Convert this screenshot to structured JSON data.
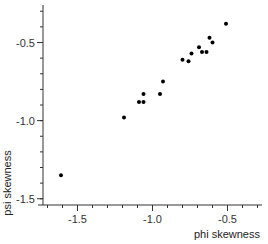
{
  "chart_data": {
    "type": "scatter",
    "title": "",
    "xlabel": "phi skewness",
    "ylabel": "psi skewness",
    "xlim": [
      -1.73,
      -0.27
    ],
    "ylim": [
      -1.54,
      -0.26
    ],
    "grid": false,
    "legend": null,
    "x_ticks": {
      "major": [
        -1.5,
        -1.0,
        -0.5
      ],
      "labels": [
        "-1.5",
        "-1.0",
        "-0.5"
      ],
      "minor_step": 0.1
    },
    "y_ticks": {
      "major": [
        -1.5,
        -1.0,
        -0.5
      ],
      "labels": [
        "-1.5",
        "-1.0",
        "-0.5"
      ],
      "minor_step": 0.1
    },
    "series": [
      {
        "name": "samples",
        "color": "#000000",
        "points": [
          {
            "x": -1.61,
            "y": -1.35
          },
          {
            "x": -1.19,
            "y": -0.98
          },
          {
            "x": -1.09,
            "y": -0.88
          },
          {
            "x": -1.06,
            "y": -0.88
          },
          {
            "x": -1.06,
            "y": -0.83
          },
          {
            "x": -0.95,
            "y": -0.83
          },
          {
            "x": -0.93,
            "y": -0.75
          },
          {
            "x": -0.8,
            "y": -0.61
          },
          {
            "x": -0.76,
            "y": -0.62
          },
          {
            "x": -0.74,
            "y": -0.57
          },
          {
            "x": -0.69,
            "y": -0.53
          },
          {
            "x": -0.67,
            "y": -0.56
          },
          {
            "x": -0.64,
            "y": -0.56
          },
          {
            "x": -0.62,
            "y": -0.47
          },
          {
            "x": -0.6,
            "y": -0.5
          },
          {
            "x": -0.51,
            "y": -0.38
          }
        ]
      }
    ]
  }
}
